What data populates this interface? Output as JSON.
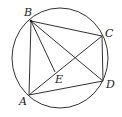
{
  "diagram": {
    "type": "geometry",
    "circle": {
      "cx": 60,
      "cy": 58,
      "rx": 48,
      "ry": 50
    },
    "points": [
      {
        "id": "A",
        "label": "A",
        "x": 29,
        "y": 95,
        "lx": 19,
        "ly": 105
      },
      {
        "id": "B",
        "label": "B",
        "x": 31,
        "y": 21,
        "lx": 24,
        "ly": 16
      },
      {
        "id": "C",
        "label": "C",
        "x": 102,
        "y": 36,
        "lx": 105,
        "ly": 37
      },
      {
        "id": "D",
        "label": "D",
        "x": 103,
        "y": 81,
        "lx": 106,
        "ly": 88
      },
      {
        "id": "E",
        "label": "E",
        "x": 55,
        "y": 72,
        "lx": 55,
        "ly": 83
      }
    ],
    "segments": [
      [
        "A",
        "B"
      ],
      [
        "B",
        "C"
      ],
      [
        "C",
        "D"
      ],
      [
        "D",
        "A"
      ],
      [
        "A",
        "C"
      ],
      [
        "B",
        "D"
      ],
      [
        "B",
        "E"
      ]
    ]
  }
}
